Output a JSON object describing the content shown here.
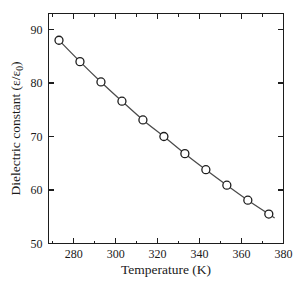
{
  "chart_data": {
    "type": "line",
    "title": "",
    "subtitle": "",
    "xlabel": "Temperature (K)",
    "ylabel": "Dielectric constant (ε/ε₀)",
    "ylabel_parts": {
      "main": "Dielectric constant (",
      "eps1": "ε",
      "slash": "/",
      "eps2": "ε",
      "subscript": "0",
      "close": ")"
    },
    "grid": false,
    "legend": "none",
    "xlim": [
      268,
      380
    ],
    "ylim": [
      50,
      93
    ],
    "x_ticks": [
      280,
      300,
      320,
      340,
      360,
      380
    ],
    "x_tick_labels": [
      "280",
      "300",
      "320",
      "340",
      "360",
      "380"
    ],
    "x_minor_ticks": [
      270,
      290,
      310,
      330,
      350,
      370
    ],
    "y_ticks": [
      50,
      60,
      70,
      80,
      90
    ],
    "y_tick_labels": [
      "50",
      "60",
      "70",
      "80",
      "90"
    ],
    "series": [
      {
        "name": "dielectric constant vs temperature",
        "marker": "open-circle",
        "x": [
          273,
          283,
          293,
          303,
          313,
          323,
          333,
          343,
          353,
          363,
          373
        ],
        "values": [
          88.0,
          84.0,
          80.2,
          76.6,
          73.1,
          70.0,
          66.8,
          63.8,
          60.9,
          58.1,
          55.5
        ]
      }
    ],
    "colors": {
      "line": "#4a4a4a",
      "marker_stroke": "#1d1d1d",
      "marker_fill": "#ffffff",
      "axis": "#1d1d1d",
      "background": "#ffffff",
      "text": "#1a1a1a"
    }
  }
}
